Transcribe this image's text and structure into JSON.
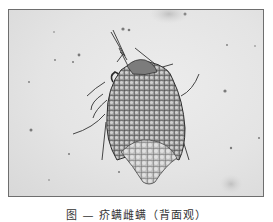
{
  "figure": {
    "background_color": "#e6e6e6",
    "border_color": "#6e6e6e"
  },
  "caption": {
    "text": "图 — 疥螨雌螨（背面观）"
  }
}
